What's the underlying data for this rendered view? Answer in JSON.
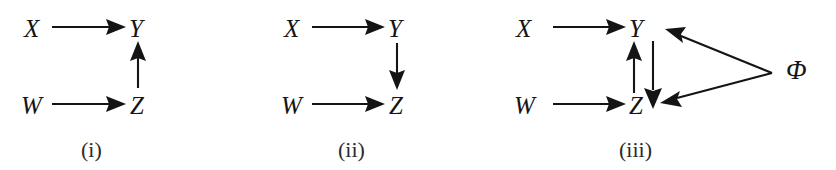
{
  "figure": {
    "background_color": "#ffffff",
    "ink_color": "#141414",
    "panel_count": 3
  },
  "panels": [
    {
      "id": "panel-i",
      "caption": "(i)",
      "nodes": [
        {
          "id": "X",
          "label": "X"
        },
        {
          "id": "Y",
          "label": "Y"
        },
        {
          "id": "W",
          "label": "W"
        },
        {
          "id": "Z",
          "label": "Z"
        }
      ],
      "edges": [
        {
          "from": "X",
          "to": "Y",
          "direction": "right"
        },
        {
          "from": "W",
          "to": "Z",
          "direction": "right"
        },
        {
          "from": "Z",
          "to": "Y",
          "direction": "up"
        }
      ]
    },
    {
      "id": "panel-ii",
      "caption": "(ii)",
      "nodes": [
        {
          "id": "X",
          "label": "X"
        },
        {
          "id": "Y",
          "label": "Y"
        },
        {
          "id": "W",
          "label": "W"
        },
        {
          "id": "Z",
          "label": "Z"
        }
      ],
      "edges": [
        {
          "from": "X",
          "to": "Y",
          "direction": "right"
        },
        {
          "from": "W",
          "to": "Z",
          "direction": "right"
        },
        {
          "from": "Y",
          "to": "Z",
          "direction": "down"
        }
      ]
    },
    {
      "id": "panel-iii",
      "caption": "(iii)",
      "nodes": [
        {
          "id": "X",
          "label": "X"
        },
        {
          "id": "Y",
          "label": "Y"
        },
        {
          "id": "W",
          "label": "W"
        },
        {
          "id": "Z",
          "label": "Z"
        },
        {
          "id": "PHI",
          "label": "Φ"
        }
      ],
      "edges": [
        {
          "from": "X",
          "to": "Y",
          "direction": "right"
        },
        {
          "from": "W",
          "to": "Z",
          "direction": "right"
        },
        {
          "from": "Z",
          "to": "Y",
          "direction": "up"
        },
        {
          "from": "Y",
          "to": "Z",
          "direction": "down"
        },
        {
          "from": "PHI",
          "to": "Y",
          "direction": "up-left"
        },
        {
          "from": "PHI",
          "to": "Z",
          "direction": "down-left"
        }
      ]
    }
  ],
  "labels": {
    "p1_X": "X",
    "p1_Y": "Y",
    "p1_W": "W",
    "p1_Z": "Z",
    "p1_caption": "(i)",
    "p2_X": "X",
    "p2_Y": "Y",
    "p2_W": "W",
    "p2_Z": "Z",
    "p2_caption": "(ii)",
    "p3_X": "X",
    "p3_Y": "Y",
    "p3_W": "W",
    "p3_Z": "Z",
    "p3_PHI": "Φ",
    "p3_caption": "(iii)"
  }
}
